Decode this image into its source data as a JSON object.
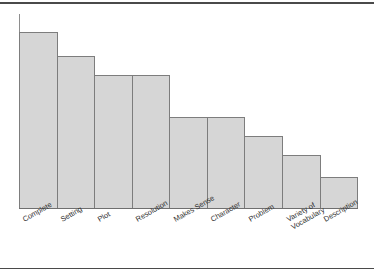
{
  "chart_data": {
    "type": "bar",
    "title": "",
    "subtitle": "",
    "xlabel": "",
    "ylabel": "",
    "grid": false,
    "legend": null,
    "axis": {
      "y_visible": true,
      "y_ticks": [],
      "x_visible": true,
      "ylim": [
        0,
        100
      ]
    },
    "categories": [
      "Complete",
      "Setting",
      "Plot",
      "Resolution",
      "Makes Sense",
      "Character",
      "Problem",
      "Variety of Vocabulary",
      "Description"
    ],
    "category_lines": [
      [
        "Complete"
      ],
      [
        "Setting"
      ],
      [
        "Plot"
      ],
      [
        "Resolution"
      ],
      [
        "Makes Sense"
      ],
      [
        "Character"
      ],
      [
        "Problem"
      ],
      [
        "Variety of",
        "Vocabulary"
      ],
      [
        "Description"
      ]
    ],
    "values": [
      91,
      78,
      69,
      69,
      47,
      47,
      37,
      27,
      16
    ],
    "bar_heights_px": [
      176,
      152,
      133,
      133,
      91,
      91,
      72,
      53,
      31
    ],
    "colors": {
      "bar_fill": "#d6d6d6",
      "bar_border": "#7d7d7d",
      "axis": "#6f6f6f",
      "label_text": "#333333",
      "rule": "#4a4a4a",
      "background": "#ffffff"
    }
  },
  "page": {
    "top_rule": "",
    "bottom_rule": ""
  }
}
